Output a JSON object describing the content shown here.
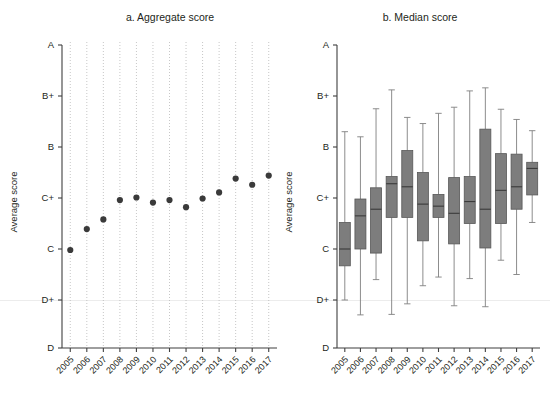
{
  "figure": {
    "background_color": "#ffffff",
    "width": 550,
    "height": 394
  },
  "panel_a": {
    "title": "a. Aggregate score",
    "ylabel": "Average score"
  },
  "panel_b": {
    "title": "b. Median score",
    "ylabel": "Average score"
  },
  "chart_data": [
    {
      "type": "scatter",
      "panel": "a",
      "title": "a. Aggregate score",
      "xlabel": "",
      "ylabel": "Average score",
      "grid": "vertical-dotted",
      "legend": "none",
      "categories": [
        "2005",
        "2006",
        "2007",
        "2008",
        "2009",
        "2010",
        "2011",
        "2012",
        "2013",
        "2014",
        "2015",
        "2016",
        "2017"
      ],
      "ytick_labels": [
        "A",
        "B+",
        "B",
        "C+",
        "C",
        "D+",
        "D"
      ],
      "ytick_values": [
        6,
        5,
        4,
        3,
        2,
        1,
        0
      ],
      "ylim": [
        0,
        6
      ],
      "yscale_note": "Letter-grade ordinal scale: D=0, D+=1, C=2, C+=3, B=4, B+=5, A=6",
      "values": [
        1.98,
        2.39,
        2.58,
        2.96,
        3.01,
        2.91,
        2.96,
        2.82,
        2.99,
        3.11,
        3.38,
        3.26,
        3.44
      ],
      "value_labels": [
        "C",
        "C/C+",
        "C/C+",
        "C+",
        "C+",
        "C+",
        "C+",
        "C+",
        "C+",
        "C+",
        "C+/B",
        "C+/B",
        "C+/B"
      ],
      "marker": "filled-circle",
      "marker_color": "#3a3a3a"
    },
    {
      "type": "box",
      "panel": "b",
      "title": "b. Median score",
      "xlabel": "",
      "ylabel": "Average score",
      "grid": "none",
      "legend": "none",
      "categories": [
        "2005",
        "2006",
        "2007",
        "2008",
        "2009",
        "2010",
        "2011",
        "2012",
        "2013",
        "2014",
        "2015",
        "2016",
        "2017"
      ],
      "ytick_labels": [
        "A",
        "B+",
        "B",
        "C+",
        "C",
        "D+",
        "D"
      ],
      "ytick_values": [
        6,
        5,
        4,
        3,
        2,
        1,
        0
      ],
      "ylim": [
        0,
        6
      ],
      "yscale_note": "Letter-grade ordinal scale: D=0, D+=1, C=2, C+=3, B=4, B+=5, A=6",
      "box_color": "#7d7d7d",
      "boxes": [
        {
          "category": "2005",
          "whisker_low": 1.0,
          "q1": 1.67,
          "median": 2.0,
          "q3": 2.52,
          "whisker_high": 4.3
        },
        {
          "category": "2006",
          "whisker_low": 0.69,
          "q1": 2.0,
          "median": 2.65,
          "q3": 2.98,
          "whisker_high": 4.2
        },
        {
          "category": "2007",
          "whisker_low": 1.4,
          "q1": 1.92,
          "median": 2.78,
          "q3": 3.2,
          "whisker_high": 4.75
        },
        {
          "category": "2008",
          "whisker_low": 0.7,
          "q1": 2.62,
          "median": 3.28,
          "q3": 3.42,
          "whisker_high": 5.12
        },
        {
          "category": "2009",
          "whisker_low": 0.92,
          "q1": 2.62,
          "median": 3.22,
          "q3": 3.93,
          "whisker_high": 4.58
        },
        {
          "category": "2010",
          "whisker_low": 1.28,
          "q1": 2.16,
          "median": 2.88,
          "q3": 3.5,
          "whisker_high": 4.46
        },
        {
          "category": "2011",
          "whisker_low": 1.45,
          "q1": 2.62,
          "median": 2.84,
          "q3": 3.07,
          "whisker_high": 4.66
        },
        {
          "category": "2012",
          "whisker_low": 0.88,
          "q1": 2.1,
          "median": 2.7,
          "q3": 3.4,
          "whisker_high": 4.78
        },
        {
          "category": "2013",
          "whisker_low": 1.42,
          "q1": 2.5,
          "median": 2.93,
          "q3": 3.42,
          "whisker_high": 5.1
        },
        {
          "category": "2014",
          "whisker_low": 0.86,
          "q1": 2.02,
          "median": 2.78,
          "q3": 4.35,
          "whisker_high": 5.16
        },
        {
          "category": "2015",
          "whisker_low": 1.78,
          "q1": 2.5,
          "median": 3.15,
          "q3": 3.87,
          "whisker_high": 4.74
        },
        {
          "category": "2016",
          "whisker_low": 1.5,
          "q1": 2.78,
          "median": 3.22,
          "q3": 3.86,
          "whisker_high": 4.54
        },
        {
          "category": "2017",
          "whisker_low": 2.52,
          "q1": 3.06,
          "median": 3.58,
          "q3": 3.7,
          "whisker_high": 4.32
        }
      ]
    }
  ]
}
